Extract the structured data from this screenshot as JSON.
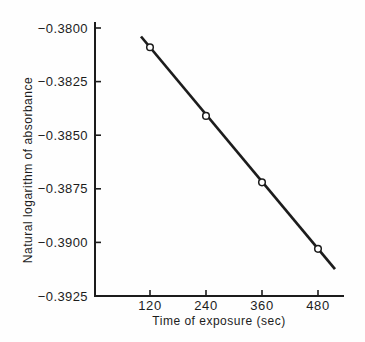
{
  "figure": {
    "background": "#fefefe",
    "ink_color": "#1c1c1c",
    "marker_fill": "#ffffff"
  },
  "chart_data": {
    "type": "line",
    "title": "",
    "xlabel": "Time of exposure (sec)",
    "ylabel": "Natural logarithm of absorbance",
    "x": [
      120,
      240,
      360,
      480
    ],
    "y": [
      -0.3809,
      -0.3841,
      -0.3872,
      -0.3903
    ],
    "series": [
      {
        "name": "ln(absorbance) vs time",
        "x": [
          120,
          240,
          360,
          480
        ],
        "values": [
          -0.3809,
          -0.3841,
          -0.3872,
          -0.3903
        ]
      }
    ],
    "xticks": [
      120,
      240,
      360,
      480
    ],
    "xtick_labels": [
      "120",
      "240",
      "360",
      "480"
    ],
    "yticks": [
      -0.38,
      -0.3825,
      -0.385,
      -0.3875,
      -0.39,
      -0.3925
    ],
    "ytick_labels": [
      "−0.3800",
      "−0.3825",
      "−0.3850",
      "−0.3875",
      "−0.3900",
      "−0.3925"
    ],
    "xlim": [
      2,
      534
    ],
    "ylim": [
      -0.3925,
      -0.3797
    ],
    "grid": false,
    "legend": null,
    "marker": "open-circle",
    "line_color": "#1c1c1c"
  }
}
